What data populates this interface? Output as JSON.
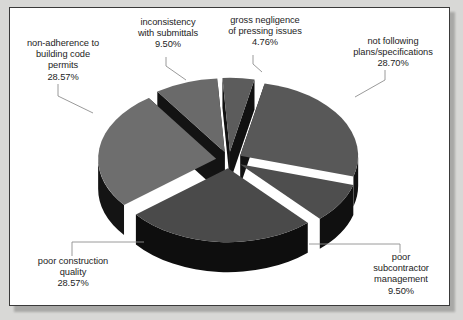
{
  "chart_data": {
    "type": "pie",
    "title": "",
    "subtitle": "",
    "xlabel": "",
    "ylabel": "",
    "exploded": true,
    "three_d": true,
    "legend_position": "none",
    "grid": false,
    "units": "percent",
    "categories": [
      "not following plans/specifications",
      "poor subcontractor management",
      "poor construction quality",
      "non-adherence to building code permits",
      "inconsistency with submittals",
      "gross negligence of pressing issues"
    ],
    "values": [
      28.7,
      9.5,
      28.57,
      28.57,
      9.5,
      4.76
    ],
    "value_labels": [
      "28.70%",
      "9.50%",
      "28.57%",
      "28.57%",
      "9.50%",
      "4.76%"
    ],
    "slices": [
      {
        "id": "not-following-plans",
        "name": "not following plans/specifications",
        "value": 28.7,
        "value_label": "28.70%",
        "top_color": "#585858",
        "side_color": "#121212",
        "label_lines": [
          "not following",
          "plans/specifications"
        ]
      },
      {
        "id": "poor-subcontractor-management",
        "name": "poor subcontractor management",
        "value": 9.5,
        "value_label": "9.50%",
        "top_color": "#4e4e4e",
        "side_color": "#101010",
        "label_lines": [
          "poor",
          "subcontractor",
          "management"
        ]
      },
      {
        "id": "poor-construction-quality",
        "name": "poor construction quality",
        "value": 28.57,
        "value_label": "28.57%",
        "top_color": "#4a4a4a",
        "side_color": "#0e0e0e",
        "label_lines": [
          "poor construction",
          "quality"
        ]
      },
      {
        "id": "non-adherence-building-code-permits",
        "name": "non-adherence to building code permits",
        "value": 28.57,
        "value_label": "28.57%",
        "top_color": "#6e6e6e",
        "side_color": "#141414",
        "label_lines": [
          "non-adherence to",
          "building code",
          "permits"
        ]
      },
      {
        "id": "inconsistency-with-submittals",
        "name": "inconsistency with submittals",
        "value": 9.5,
        "value_label": "9.50%",
        "top_color": "#6a6a6a",
        "side_color": "#131313",
        "label_lines": [
          "inconsistency",
          "with submittals"
        ]
      },
      {
        "id": "gross-negligence-pressing-issues",
        "name": "gross negligence of pressing issues",
        "value": 4.76,
        "value_label": "4.76%",
        "top_color": "#5c5c5c",
        "side_color": "#111111",
        "label_lines": [
          "gross negligence",
          "of pressing issues"
        ]
      }
    ],
    "colors": {
      "background": "#ffffff",
      "page_background": "#d8d8d6",
      "frame_border": "#3a3a3a",
      "text": "#1d1d1d",
      "leader_line": "#8e8e8e"
    }
  }
}
